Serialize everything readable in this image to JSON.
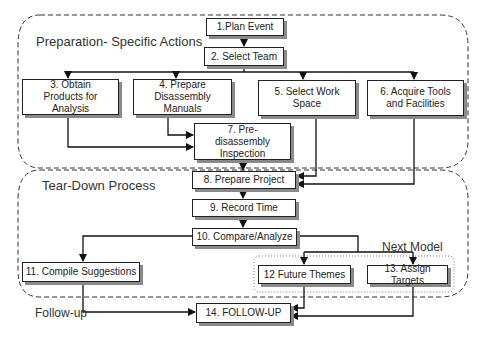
{
  "regions": {
    "preparation": "Preparation- Specific Actions",
    "teardown": "Tear-Down Process",
    "next_model": "Next Model",
    "follow_up": "Follow-up"
  },
  "steps": [
    {
      "id": 1,
      "label": "1.Plan Event"
    },
    {
      "id": 2,
      "label": "2. Select Team"
    },
    {
      "id": 3,
      "label": "3. Obtain Products for Analysis"
    },
    {
      "id": 4,
      "label": "4. Prepare Disassembly Manuals"
    },
    {
      "id": 5,
      "label": "5. Select Work Space"
    },
    {
      "id": 6,
      "label": "6. Acquire Tools and Facilities"
    },
    {
      "id": 7,
      "label": "7. Pre-disassembly Inspection"
    },
    {
      "id": 8,
      "label": "8. Prepare Project"
    },
    {
      "id": 9,
      "label": "9. Record Time"
    },
    {
      "id": 10,
      "label": "10. Compare/Analyze"
    },
    {
      "id": 11,
      "label": "11. Compile Suggestions"
    },
    {
      "id": 12,
      "label": "12 Future Themes"
    },
    {
      "id": 13,
      "label": "13. Assign Targets"
    },
    {
      "id": 14,
      "label": "14. FOLLOW-UP"
    }
  ],
  "edges": [
    [
      1,
      2
    ],
    [
      2,
      3
    ],
    [
      2,
      4
    ],
    [
      2,
      5
    ],
    [
      2,
      6
    ],
    [
      3,
      7
    ],
    [
      4,
      7
    ],
    [
      7,
      8
    ],
    [
      5,
      8
    ],
    [
      6,
      8
    ],
    [
      8,
      9
    ],
    [
      9,
      10
    ],
    [
      10,
      11
    ],
    [
      10,
      12
    ],
    [
      10,
      13
    ],
    [
      11,
      14
    ],
    [
      12,
      14
    ],
    [
      13,
      14
    ]
  ]
}
